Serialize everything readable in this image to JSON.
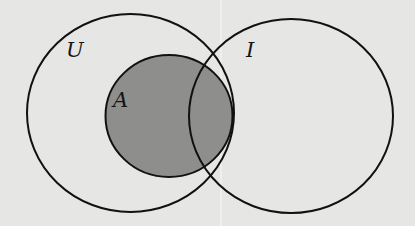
{
  "diagram": {
    "type": "venn",
    "background": "#e6e6e4",
    "stroke_color": "#111111",
    "shade_color": "#8e8e8c",
    "sets": [
      {
        "id": "U",
        "label": "U",
        "shaded": false,
        "cx": 130.5,
        "cy": 113,
        "rx": 103.5,
        "ry": 99
      },
      {
        "id": "A",
        "label": "A",
        "shaded": true,
        "subset_of": "U",
        "cx": 169,
        "cy": 116,
        "rx": 63.5,
        "ry": 61
      },
      {
        "id": "I",
        "label": "I",
        "shaded": false,
        "cx": 291,
        "cy": 116,
        "rx": 102,
        "ry": 97
      }
    ],
    "labels": {
      "u": "U",
      "a": "A",
      "i": "I"
    }
  }
}
